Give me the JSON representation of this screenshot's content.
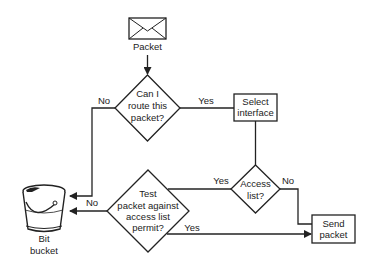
{
  "diagram": {
    "colors": {
      "stroke": "#222222",
      "background": "#ffffff"
    },
    "nodes": {
      "packet": {
        "label": "Packet",
        "icon": "envelope-icon"
      },
      "can_route": {
        "lines": [
          "Can I",
          "route this",
          "packet?"
        ]
      },
      "select_interface": {
        "lines": [
          "Select",
          "interface"
        ]
      },
      "access_list": {
        "lines": [
          "Access",
          "list?"
        ]
      },
      "test_packet": {
        "lines": [
          "Test",
          "packet against",
          "access list",
          "permit?"
        ]
      },
      "send_packet": {
        "lines": [
          "Send",
          "packet"
        ]
      },
      "bit_bucket": {
        "lines": [
          "Bit",
          "bucket"
        ],
        "icon": "bucket-icon"
      }
    },
    "edges": {
      "can_route_no": "No",
      "can_route_yes": "Yes",
      "access_yes": "Yes",
      "access_no": "No",
      "test_no": "No",
      "test_yes": "Yes"
    }
  }
}
